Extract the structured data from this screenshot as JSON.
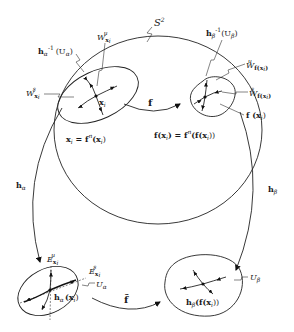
{
  "diagram": {
    "sphere_label": "S",
    "sphere_sup": "2",
    "top_left": {
      "preimage_label_h": "h",
      "preimage_label_sub": "α",
      "preimage_label_sup": "-1",
      "preimage_label_arg": "(U",
      "preimage_label_arg_sub": "α",
      "preimage_label_close": ")",
      "unstable_W": "W",
      "unstable_sub": "x",
      "unstable_subsub": "i",
      "unstable_sup": "u",
      "stable_W": "W",
      "stable_sub": "x",
      "stable_subsub": "i",
      "stable_sup": "s",
      "point_label": "x",
      "point_sub": "i",
      "equation": "x",
      "equation_sub": "i",
      "equation_rest": " = f",
      "equation_sup": "n",
      "equation_arg": "(x",
      "equation_arg_sub": "i",
      "equation_close": ")"
    },
    "top_right": {
      "preimage_label_h": "h",
      "preimage_label_sub": "β",
      "preimage_label_sup": "-1",
      "preimage_label_arg": "(U",
      "preimage_label_arg_sub": "β",
      "preimage_label_close": ")",
      "unstable_W": "W",
      "unstable_sub": "f(x",
      "unstable_subsub": "i",
      "unstable_close": ")",
      "unstable_sup": "u",
      "stable_W": "W",
      "stable_sub": "f(x",
      "stable_subsub": "i",
      "stable_close": ")",
      "stable_sup": "s",
      "point_label": "f (x",
      "point_sub": "i",
      "point_close": ")",
      "equation": "f(x",
      "equation_sub": "i",
      "equation_rest": ") = f",
      "equation_sup": "n",
      "equation_arg": "(f(x",
      "equation_arg_sub": "i",
      "equation_close": "))"
    },
    "map_f": "f",
    "map_h_alpha": "h",
    "map_h_alpha_sub": "α",
    "map_h_beta": "h",
    "map_h_beta_sub": "β",
    "map_f_tilde": "f̃",
    "bottom_left": {
      "unstable_E": "E",
      "unstable_sub": "x",
      "unstable_subsub": "i",
      "unstable_sup": "u",
      "stable_E": "E",
      "stable_sub": "x",
      "stable_subsub": "i",
      "stable_sup": "s",
      "region_U": "U",
      "region_sub": "α",
      "point_h": "h",
      "point_h_sub": "α",
      "point_arg": "(x",
      "point_arg_sub": "i",
      "point_close": ")"
    },
    "bottom_right": {
      "region_U": "U",
      "region_sub": "β",
      "point_h": "h",
      "point_h_sub": "β",
      "point_arg": "(f(x",
      "point_arg_sub": "i",
      "point_close": "))"
    }
  }
}
